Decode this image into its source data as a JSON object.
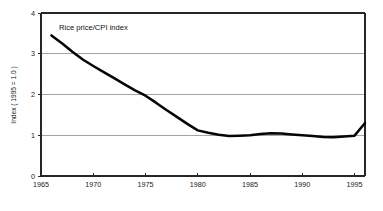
{
  "chart_data": {
    "type": "line",
    "title": "",
    "annotation": "Rice price/CPI index",
    "xlabel": "",
    "ylabel": "Index ( 1995 = 1.0 )",
    "xlim": [
      1965,
      1996
    ],
    "ylim": [
      0,
      4
    ],
    "grid": "horizontal",
    "legend_position": "none",
    "xticks": [
      1965,
      1970,
      1975,
      1980,
      1985,
      1990,
      1995
    ],
    "xtick_labels": [
      "1965",
      "1970",
      "1975",
      "1980",
      "1985",
      "1990",
      "1995"
    ],
    "yticks": [
      0,
      1,
      2,
      3,
      4
    ],
    "ytick_labels": [
      "0",
      "1",
      "2",
      "3",
      "4"
    ],
    "gridline_values": [
      1,
      2,
      3
    ],
    "series": [
      {
        "name": "Rice price/CPI index",
        "color": "#050505",
        "x": [
          1966,
          1967,
          1968,
          1969,
          1970,
          1971,
          1972,
          1973,
          1974,
          1975,
          1976,
          1977,
          1978,
          1979,
          1980,
          1981,
          1982,
          1983,
          1984,
          1985,
          1986,
          1987,
          1988,
          1989,
          1990,
          1991,
          1992,
          1993,
          1994,
          1995,
          1996
        ],
        "values": [
          3.45,
          3.26,
          3.05,
          2.86,
          2.7,
          2.55,
          2.4,
          2.25,
          2.1,
          1.97,
          1.8,
          1.62,
          1.45,
          1.28,
          1.12,
          1.06,
          1.01,
          0.98,
          0.99,
          1.0,
          1.03,
          1.05,
          1.04,
          1.02,
          1.0,
          0.98,
          0.96,
          0.95,
          0.97,
          0.99,
          1.3
        ]
      }
    ]
  },
  "axis": {
    "y_title": "Index ( 1995 = 1.0 )"
  },
  "annotation": {
    "series_label": "Rice price/CPI index"
  }
}
